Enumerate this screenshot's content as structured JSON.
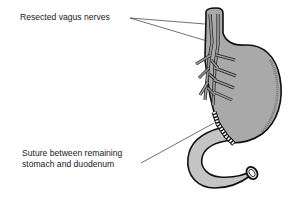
{
  "figure": {
    "colors": {
      "stomach_fill": "#a9a9a9",
      "duodenum_fill": "#c4c4c4",
      "outline": "#111111",
      "nerve_fill": "#9a9a9a",
      "leader_line": "#333333"
    }
  },
  "labels": {
    "vagus": "Resected vagus nerves",
    "suture_line1": "Suture between remaining",
    "suture_line2": "stomach and duodenum"
  }
}
